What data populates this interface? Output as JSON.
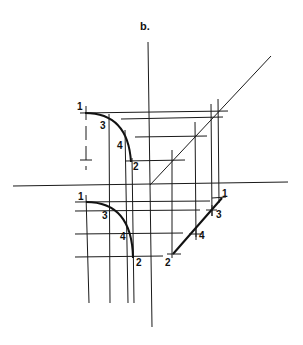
{
  "figure": {
    "title": "b.",
    "line_color": "#111111",
    "background": "#ffffff"
  },
  "upper_view": {
    "points": [
      {
        "label": "1",
        "x": 77,
        "y": 110
      },
      {
        "label": "3",
        "x": 100,
        "y": 126
      },
      {
        "label": "4",
        "x": 118,
        "y": 146
      },
      {
        "label": "2",
        "x": 135,
        "y": 169
      }
    ]
  },
  "lower_view": {
    "points": [
      {
        "label": "1",
        "x": 80,
        "y": 201
      },
      {
        "label": "3",
        "x": 104,
        "y": 218
      },
      {
        "label": "4",
        "x": 122,
        "y": 240
      },
      {
        "label": "2",
        "x": 138,
        "y": 264
      }
    ]
  },
  "edge_view": {
    "points": [
      {
        "label": "1",
        "x": 223,
        "y": 198
      },
      {
        "label": "3",
        "x": 216,
        "y": 217
      },
      {
        "label": "4",
        "x": 199,
        "y": 238
      },
      {
        "label": "2",
        "x": 165,
        "y": 266
      }
    ]
  }
}
